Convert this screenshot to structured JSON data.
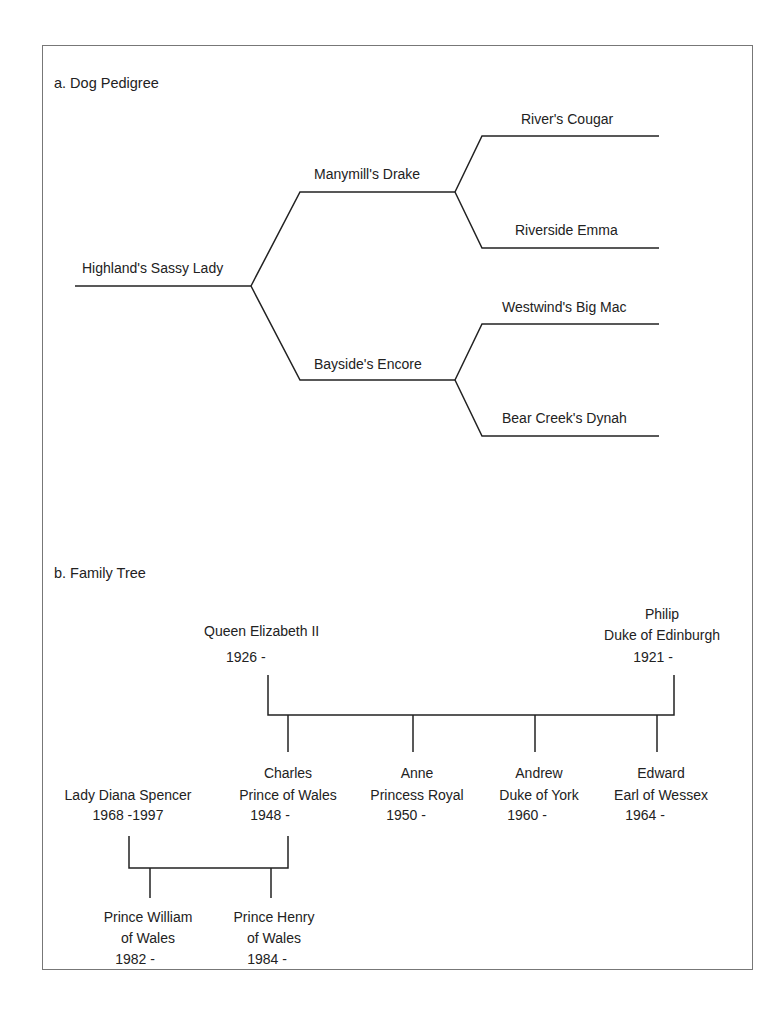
{
  "pedigree": {
    "title": "a. Dog Pedigree",
    "root": "Highland's Sassy Lady",
    "sire": "Manymill's Drake",
    "dam": "Bayside's Encore",
    "sire_sire": "River's Cougar",
    "sire_dam": "Riverside Emma",
    "dam_sire": "Westwind's Big Mac",
    "dam_dam": "Bear Creek's Dynah"
  },
  "family": {
    "title": "b. Family Tree",
    "queen": {
      "name": "Queen Elizabeth II",
      "years": "1926 -"
    },
    "philip": {
      "name": "Philip",
      "title": "Duke of Edinburgh",
      "years": "1921 -"
    },
    "diana": {
      "name": "Lady Diana Spencer",
      "years": "1968 -1997"
    },
    "children": [
      {
        "name": "Charles",
        "title": "Prince of Wales",
        "years": "1948 -"
      },
      {
        "name": "Anne",
        "title": "Princess Royal",
        "years": "1950 -"
      },
      {
        "name": "Andrew",
        "title": "Duke of York",
        "years": "1960 -"
      },
      {
        "name": "Edward",
        "title": "Earl of Wessex",
        "years": "1964 -"
      }
    ],
    "grandchildren": [
      {
        "name": "Prince William",
        "title": "of Wales",
        "years": "1982 -"
      },
      {
        "name": "Prince Henry",
        "title": "of Wales",
        "years": "1984 -"
      }
    ]
  }
}
